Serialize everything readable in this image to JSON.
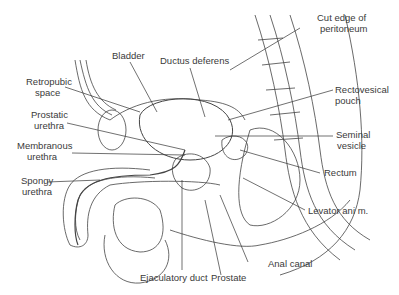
{
  "figure": {
    "type": "anatomical sagittal section"
  },
  "labels": {
    "bladder": "Bladder",
    "ductus_deferens": "Ductus deferens",
    "cut_edge_1": "Cut edge of",
    "cut_edge_2": "peritoneum",
    "retropubic_1": "Retropubic",
    "retropubic_2": "space",
    "prostatic_1": "Prostatic",
    "prostatic_2": "urethra",
    "membranous_1": "Membranous",
    "membranous_2": "urethra",
    "spongy_1": "Spongy",
    "spongy_2": "urethra",
    "rectovesical_1": "Rectovesical",
    "rectovesical_2": "pouch",
    "seminal_1": "Seminal",
    "seminal_2": "vesicle",
    "rectum": "Rectum",
    "levator": "Levator ani m.",
    "anal_canal": "Anal canal",
    "prostate": "Prostate",
    "ejaculatory": "Ejaculatory duct"
  },
  "colors": {
    "ink": "#3a3a3a",
    "background": "#ffffff"
  }
}
